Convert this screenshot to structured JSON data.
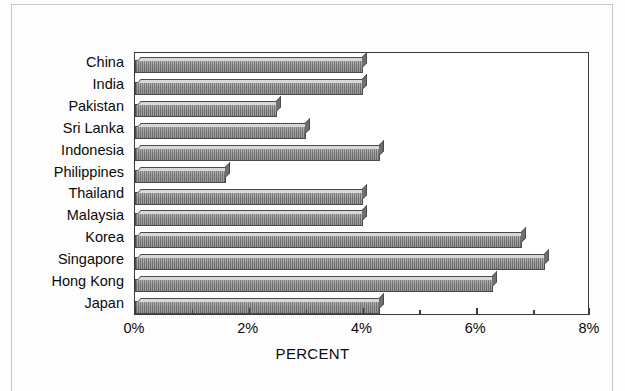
{
  "chart_data": {
    "type": "bar",
    "orientation": "horizontal",
    "title": "",
    "xlabel": "PERCENT",
    "ylabel": "",
    "categories": [
      "China",
      "India",
      "Pakistan",
      "Sri Lanka",
      "Indonesia",
      "Philippines",
      "Thailand",
      "Malaysia",
      "Korea",
      "Singapore",
      "Hong Kong",
      "Japan"
    ],
    "values": [
      4.0,
      4.0,
      2.5,
      3.0,
      4.3,
      1.6,
      4.0,
      4.0,
      6.8,
      7.2,
      6.3,
      4.3
    ],
    "xlim": [
      0,
      8
    ],
    "x_tick_labels": [
      "0%",
      "2%",
      "4%",
      "6%",
      "8%"
    ],
    "x_tick_values": [
      0,
      2,
      4,
      6,
      8
    ],
    "x_minor_tick_values": [
      1,
      3,
      5,
      7
    ],
    "grid": false,
    "legend": false,
    "bar_color": "#949494",
    "bar_edge_color": "#4a4a4a",
    "axis_color": "#3a3a3a",
    "background_color": "#ffffff"
  },
  "axis": {
    "x_title": "PERCENT"
  }
}
